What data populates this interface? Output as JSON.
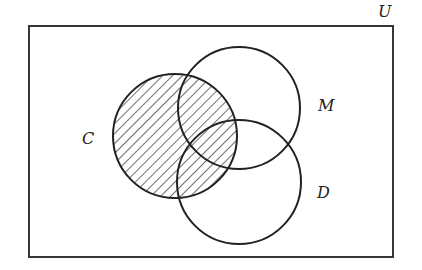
{
  "diagram": {
    "type": "venn",
    "universe": {
      "label": "U",
      "x": 29,
      "y": 26,
      "width": 364,
      "height": 231
    },
    "sets": [
      {
        "label": "C",
        "cx": 175,
        "cy": 136,
        "r": 62,
        "shaded": true,
        "label_x": 82,
        "label_y": 144
      },
      {
        "label": "M",
        "cx": 239,
        "cy": 108,
        "r": 61,
        "shaded": false,
        "label_x": 318,
        "label_y": 111
      },
      {
        "label": "D",
        "cx": 239,
        "cy": 182,
        "r": 62,
        "shaded": false,
        "label_x": 317,
        "label_y": 198
      }
    ],
    "shaded_region": "C",
    "colors": {
      "stroke": "#222222",
      "background": "#ffffff"
    }
  }
}
